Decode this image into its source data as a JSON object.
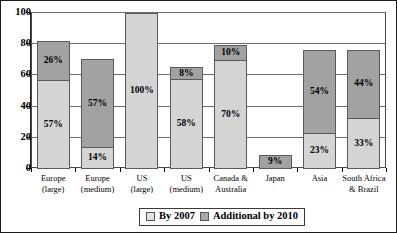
{
  "chart_data": {
    "type": "bar",
    "title": "",
    "subtitle": "",
    "xlabel": "",
    "ylabel": "",
    "ylim": [
      0,
      100
    ],
    "yticks": [
      0,
      20,
      40,
      60,
      80,
      100
    ],
    "ytick_labels": [
      "0",
      "20",
      "40",
      "60",
      "80",
      "100"
    ],
    "grid": true,
    "stacked": true,
    "legend_position": "bottom-center",
    "categories": [
      "Europe (large)",
      "Europe (medium)",
      "US (large)",
      "US (medium)",
      "Canada & Australia",
      "Japan",
      "Asia",
      "South Africa & Brazil"
    ],
    "category_lines": [
      [
        "Europe",
        "(large)"
      ],
      [
        "Europe",
        "(medium)"
      ],
      [
        "US",
        "(large)"
      ],
      [
        "US",
        "(medium)"
      ],
      [
        "Canada &",
        "Australia"
      ],
      [
        "Japan",
        ""
      ],
      [
        "Asia",
        ""
      ],
      [
        "South Africa",
        "& Brazil"
      ]
    ],
    "series": [
      {
        "name": "By 2007",
        "color": "#d4d4d4",
        "values": [
          57,
          14,
          100,
          58,
          70,
          0,
          23,
          33
        ],
        "labels": [
          "57%",
          "14%",
          "100%",
          "58%",
          "70%",
          "",
          "23%",
          "33%"
        ]
      },
      {
        "name": "Additional by 2010",
        "color": "#a2a2a2",
        "values": [
          26,
          57,
          0,
          8,
          10,
          9,
          54,
          44
        ],
        "labels": [
          "26%",
          "57%",
          "",
          "8%",
          "10%",
          "9%",
          "54%",
          "44%"
        ]
      }
    ],
    "totals": [
      83,
      71,
      100,
      66,
      80,
      9,
      77,
      77
    ],
    "legend": [
      {
        "label": "By 2007",
        "swatch": "light"
      },
      {
        "label": "Additional by 2010",
        "swatch": "dark"
      }
    ]
  }
}
